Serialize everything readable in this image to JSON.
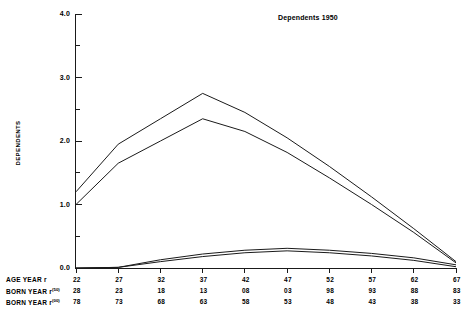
{
  "chart_data": {
    "type": "line",
    "title": "Dependents 1950",
    "xlabel": "",
    "ylabel": "DEPENDENTS",
    "ylim": [
      0.0,
      4.0
    ],
    "xlim": [
      22,
      67
    ],
    "grid": false,
    "legend_position": "none",
    "y_ticks": [
      "0.0",
      "1.0",
      "2.0",
      "3.0",
      "4.0"
    ],
    "y_tick_values": [
      0.0,
      1.0,
      2.0,
      3.0,
      4.0
    ],
    "y_minor_tick_values": [
      0.5,
      1.5,
      2.5,
      3.5
    ],
    "x": [
      22,
      27,
      32,
      37,
      42,
      47,
      52,
      57,
      62,
      67
    ],
    "axis_rows": [
      {
        "label": "AGE YEAR r",
        "label_sup": "",
        "values": [
          "22",
          "27",
          "32",
          "37",
          "42",
          "47",
          "52",
          "57",
          "62",
          "67"
        ]
      },
      {
        "label": "BORN YEAR r",
        "label_sup": "(50)",
        "values": [
          "28",
          "23",
          "18",
          "13",
          "08",
          "03",
          "98",
          "93",
          "88",
          "83"
        ]
      },
      {
        "label": "BORN YEAR r",
        "label_sup": "(00)",
        "values": [
          "78",
          "73",
          "68",
          "63",
          "58",
          "53",
          "48",
          "43",
          "38",
          "33"
        ]
      }
    ],
    "series": [
      {
        "name": "upper-outer",
        "values": [
          1.2,
          1.95,
          2.35,
          2.75,
          2.45,
          2.05,
          1.6,
          1.12,
          0.62,
          0.1
        ]
      },
      {
        "name": "upper-inner",
        "values": [
          1.0,
          1.65,
          2.0,
          2.35,
          2.15,
          1.82,
          1.42,
          1.0,
          0.56,
          0.08
        ]
      },
      {
        "name": "lower-outer",
        "values": [
          0.0,
          0.01,
          0.13,
          0.22,
          0.28,
          0.31,
          0.28,
          0.23,
          0.16,
          0.05
        ]
      },
      {
        "name": "lower-inner",
        "values": [
          0.0,
          0.01,
          0.1,
          0.18,
          0.24,
          0.27,
          0.24,
          0.19,
          0.12,
          0.02
        ]
      }
    ],
    "line_color": "#1a1a1a"
  }
}
